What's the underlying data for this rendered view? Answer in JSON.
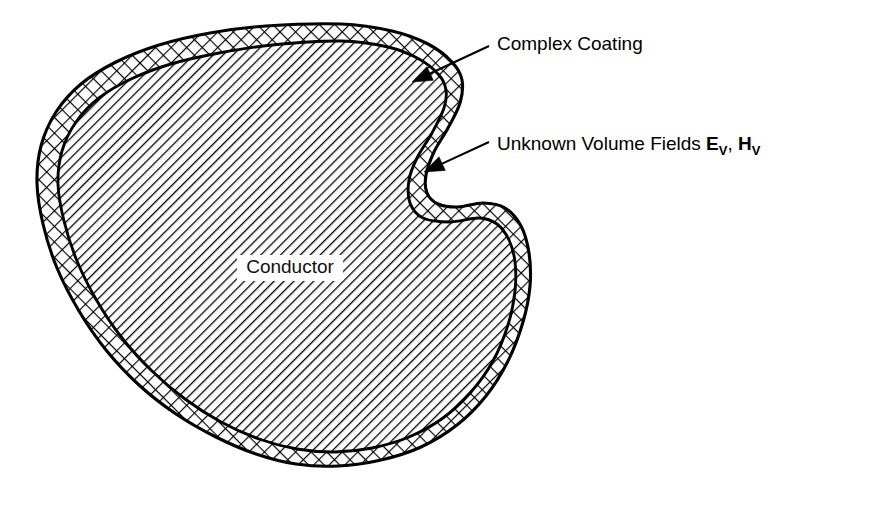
{
  "figure": {
    "kind": "technical-line-diagram",
    "background_color": "#ffffff",
    "ink_color": "#000000",
    "width": 879,
    "height": 507
  },
  "regions": {
    "conductor": {
      "label": "Conductor",
      "fill_pattern": "single-diagonal-hatch",
      "hatch_angle_deg": 45,
      "hatch_spacing_px": 7,
      "label_x": 290,
      "label_y": 273,
      "label_has_white_knockout": true
    },
    "coating": {
      "label": "Complex Coating",
      "fill_pattern": "cross-hatch-diamond",
      "band_width_px": 15
    }
  },
  "annotations": [
    {
      "id": "complex-coating",
      "text": "Complex Coating",
      "text_x": 497,
      "text_y": 50,
      "leader_from_x": 489,
      "leader_from_y": 46,
      "arrow_tip_x": 412,
      "arrow_tip_y": 82,
      "has_bold_symbols": false
    },
    {
      "id": "unknown-volume-fields",
      "text": "Unknown Volume Fields",
      "symbol_1": "E",
      "symbol_1_sub": "V",
      "separator": ", ",
      "symbol_2": "H",
      "symbol_2_sub": "V",
      "text_x": 497,
      "text_y": 150,
      "leader_from_x": 489,
      "leader_from_y": 142,
      "arrow_tip_x": 424,
      "arrow_tip_y": 172,
      "has_bold_symbols": true
    }
  ],
  "chart_data": {
    "type": "diagram",
    "title": "",
    "outer_boundary_note": "Closed kidney/bean shaped outline with a concave notch on the right flank",
    "outer_boundary_points": [
      [
        341,
        24
      ],
      [
        392,
        31
      ],
      [
        428,
        44
      ],
      [
        452,
        62
      ],
      [
        462,
        80
      ],
      [
        460,
        103
      ],
      [
        448,
        128
      ],
      [
        434,
        152
      ],
      [
        426,
        175
      ],
      [
        427,
        193
      ],
      [
        438,
        204
      ],
      [
        458,
        207
      ],
      [
        483,
        203
      ],
      [
        505,
        208
      ],
      [
        521,
        226
      ],
      [
        529,
        253
      ],
      [
        530,
        286
      ],
      [
        523,
        322
      ],
      [
        508,
        361
      ],
      [
        486,
        396
      ],
      [
        457,
        425
      ],
      [
        421,
        447
      ],
      [
        381,
        460
      ],
      [
        338,
        466
      ],
      [
        296,
        464
      ],
      [
        256,
        454
      ],
      [
        216,
        437
      ],
      [
        176,
        414
      ],
      [
        139,
        385
      ],
      [
        106,
        350
      ],
      [
        79,
        311
      ],
      [
        57,
        268
      ],
      [
        43,
        224
      ],
      [
        37,
        183
      ],
      [
        41,
        146
      ],
      [
        56,
        112
      ],
      [
        81,
        84
      ],
      [
        116,
        62
      ],
      [
        159,
        45
      ],
      [
        210,
        33
      ],
      [
        266,
        26
      ],
      [
        341,
        24
      ]
    ],
    "inner_boundary_points": [
      [
        341,
        41
      ],
      [
        388,
        47
      ],
      [
        419,
        59
      ],
      [
        439,
        75
      ],
      [
        446,
        90
      ],
      [
        444,
        108
      ],
      [
        432,
        133
      ],
      [
        417,
        158
      ],
      [
        409,
        180
      ],
      [
        410,
        203
      ],
      [
        423,
        218
      ],
      [
        450,
        222
      ],
      [
        479,
        218
      ],
      [
        497,
        224
      ],
      [
        509,
        240
      ],
      [
        515,
        262
      ],
      [
        515,
        291
      ],
      [
        508,
        325
      ],
      [
        493,
        361
      ],
      [
        471,
        392
      ],
      [
        443,
        418
      ],
      [
        409,
        437
      ],
      [
        372,
        448
      ],
      [
        335,
        452
      ],
      [
        297,
        449
      ],
      [
        259,
        439
      ],
      [
        221,
        422
      ],
      [
        185,
        399
      ],
      [
        152,
        371
      ],
      [
        122,
        338
      ],
      [
        97,
        301
      ],
      [
        77,
        261
      ],
      [
        64,
        221
      ],
      [
        58,
        184
      ],
      [
        62,
        151
      ],
      [
        76,
        122
      ],
      [
        99,
        98
      ],
      [
        131,
        79
      ],
      [
        171,
        64
      ],
      [
        219,
        53
      ],
      [
        272,
        45
      ],
      [
        341,
        41
      ]
    ]
  }
}
